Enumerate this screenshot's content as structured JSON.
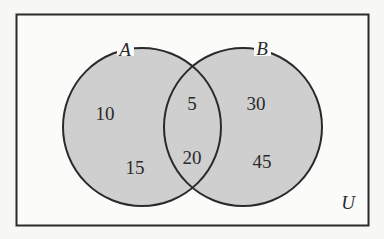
{
  "diagram": {
    "type": "venn",
    "universe_label": "U",
    "sets": [
      {
        "name": "A",
        "only": 10,
        "only_lower": 15
      },
      {
        "name": "B",
        "only": 30,
        "only_lower": 45
      }
    ],
    "regions": {
      "A_only_upper": "10",
      "A_only_lower": "15",
      "A_and_B_upper": "5",
      "A_and_B_lower": "20",
      "B_only_upper": "30",
      "B_only_lower": "45"
    },
    "labels": {
      "set_a": "A",
      "set_b": "B",
      "universe": "U"
    },
    "colors": {
      "circle_fill": "#cfcfcf",
      "stroke": "#2a2a2a",
      "background": "#f7f7f5"
    }
  }
}
